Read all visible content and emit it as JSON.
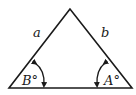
{
  "diagram": {
    "type": "triangle",
    "colors": {
      "stroke": "#1a1a1a",
      "background": "#ffffff"
    },
    "vertices": {
      "apex": [
        70,
        9
      ],
      "base_left": [
        9,
        88
      ],
      "base_right": [
        132,
        88
      ]
    },
    "sides": [
      {
        "name": "left-side",
        "label": "a"
      },
      {
        "name": "right-side",
        "label": "b"
      }
    ],
    "angles": [
      {
        "name": "angle-left",
        "label": "B°"
      },
      {
        "name": "angle-right",
        "label": "A°"
      }
    ]
  }
}
